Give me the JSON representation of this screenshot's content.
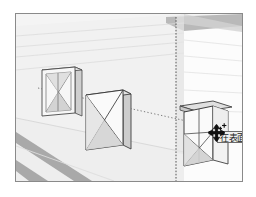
{
  "app": {
    "name": "3d-modeling-viewport",
    "type": "perspective-scene"
  },
  "viewport": {
    "border_color": "#8a8a8a",
    "background_color": "#f4f4f4",
    "left_wall_color": "#f0f0f0",
    "right_wall_color": "#fbfbfb",
    "floor_color": "#ededed",
    "stripe_color": "#a8a8a8",
    "shade_color": "#d8d8d8",
    "outline_color": "#4a4a4a"
  },
  "inference": {
    "line_color": "#6e6e6e",
    "line_style": "dotted",
    "axis_line_color": "#555555",
    "axis_line_style": "dashed",
    "label": "inference-line"
  },
  "objects": [
    {
      "id": "panel-left",
      "name": "window-panel-left",
      "state": "placed"
    },
    {
      "id": "panel-mid",
      "name": "window-panel-middle",
      "state": "placed"
    },
    {
      "id": "panel-right",
      "name": "window-panel-right",
      "state": "dragging"
    }
  ],
  "tooltip": {
    "text": "在表面上",
    "background": "#efefef",
    "border_color": "#6b6b6b",
    "text_color": "#1a1a1a"
  },
  "cursor": {
    "icon": "move-four-arrow-cursor",
    "color": "#111111",
    "badge": "plus-marks"
  }
}
